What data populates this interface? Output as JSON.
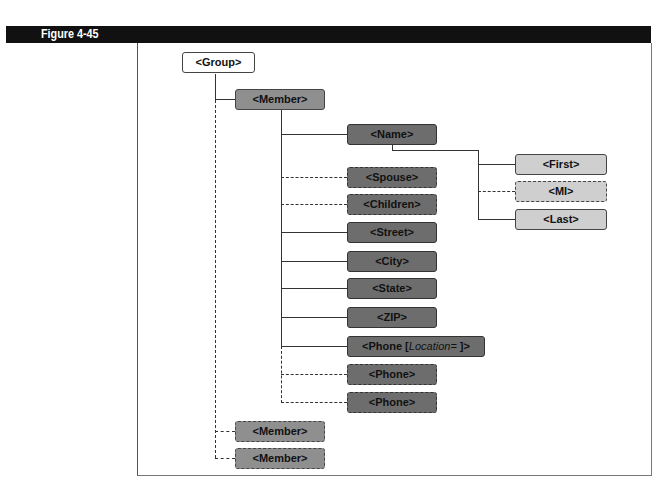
{
  "figure": {
    "label": "Figure 4-45"
  },
  "tree": {
    "root": {
      "label": "<Group>",
      "style": "solid",
      "fill": "#ffffff"
    },
    "member_main": {
      "label": "<Member>",
      "style": "solid",
      "fill": "#8f8f8f"
    },
    "member_children": [
      {
        "label": "<Name>",
        "style": "solid"
      },
      {
        "label": "<Spouse>",
        "style": "dashed"
      },
      {
        "label": "<Children>",
        "style": "dashed"
      },
      {
        "label": "<Street>",
        "style": "solid"
      },
      {
        "label": "<City>",
        "style": "solid"
      },
      {
        "label": "<State>",
        "style": "solid"
      },
      {
        "label": "<ZIP>",
        "style": "solid"
      },
      {
        "label_prefix": "<Phone [",
        "label_italic": "Location=",
        "label_suffix": " ]>",
        "style": "solid"
      },
      {
        "label": "<Phone>",
        "style": "dashed"
      },
      {
        "label": "<Phone>",
        "style": "dashed"
      }
    ],
    "name_children": [
      {
        "label": "<First>",
        "style": "solid"
      },
      {
        "label": "<MI>",
        "style": "dashed"
      },
      {
        "label": "<Last>",
        "style": "solid"
      }
    ],
    "extra_members": [
      {
        "label": "<Member>",
        "style": "dashed"
      },
      {
        "label": "<Member>",
        "style": "dashed"
      }
    ]
  },
  "colors": {
    "title_bar": "#111111",
    "root_fill": "#ffffff",
    "member_fill": "#8f8f8f",
    "member_child_fill": "#6d6d6d",
    "name_child_fill": "#cfcfcf"
  }
}
